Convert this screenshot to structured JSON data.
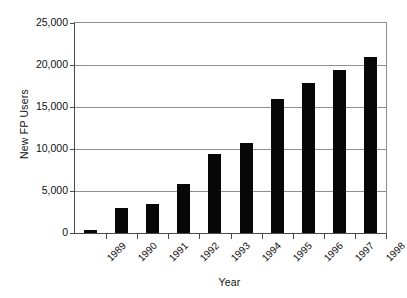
{
  "chart_data": {
    "type": "bar",
    "title": "",
    "xlabel": "Year",
    "ylabel": "New FP Users",
    "categories": [
      "1989",
      "1990",
      "1991",
      "1992",
      "1993",
      "1994",
      "1995",
      "1996",
      "1997",
      "1998"
    ],
    "values": [
      300,
      3000,
      3400,
      5800,
      9400,
      10700,
      16000,
      17900,
      19400,
      20900
    ],
    "series": [
      {
        "name": "New FP Users",
        "values": [
          300,
          3000,
          3400,
          5800,
          9400,
          10700,
          16000,
          17900,
          19400,
          20900
        ]
      }
    ],
    "ylim": [
      0,
      25000
    ],
    "ytick_values": [
      0,
      5000,
      10000,
      15000,
      20000,
      25000
    ],
    "ytick_labels": [
      "0",
      "5,000",
      "10,000",
      "15,000",
      "20,000",
      "25,000"
    ],
    "grid": "horizontal",
    "legend": "none",
    "bar_color": "#070707",
    "grid_color": "#8e8e8e",
    "axis_color": "#4a4a4a",
    "background_color": "#ffffff",
    "xtick_label_rotation": 45
  }
}
